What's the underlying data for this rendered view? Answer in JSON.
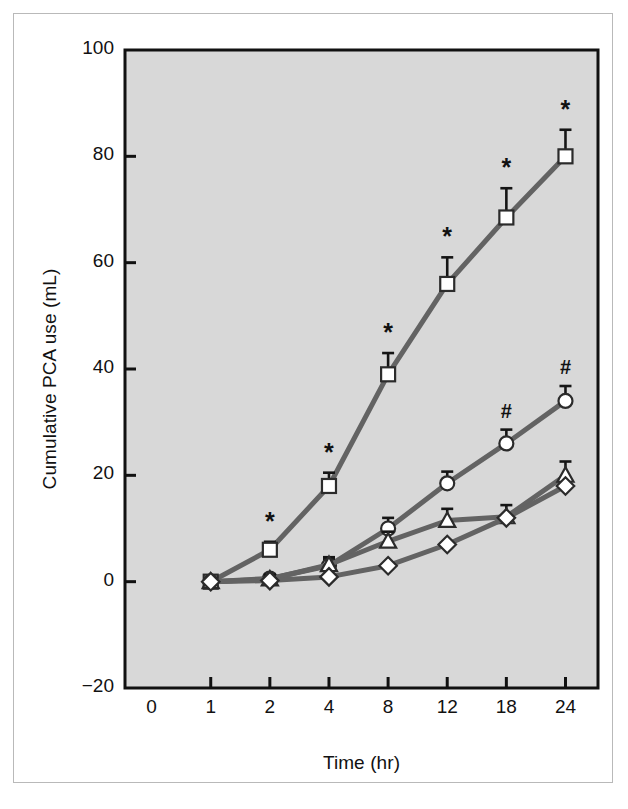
{
  "figure": {
    "background": "#ffffff",
    "plot_background": "#d8d8d8",
    "axis_color": "#111111",
    "series_line_color": "#636363",
    "marker_fill": "#ffffff",
    "marker_edge": "#2b2b2b"
  },
  "chart_data": {
    "type": "line",
    "title": "",
    "xlabel": "Time (hr)",
    "ylabel": "Cumulative PCA use (mL)",
    "x_scale": "ordinal",
    "categories": [
      "1",
      "2",
      "4",
      "8",
      "12",
      "18",
      "24"
    ],
    "xticks": [
      "0",
      "1",
      "2",
      "4",
      "8",
      "12",
      "18",
      "24"
    ],
    "yticks": [
      "-20",
      "0",
      "20",
      "40",
      "60",
      "80",
      "100"
    ],
    "ylim": [
      -20,
      100
    ],
    "grid": false,
    "legend": "none",
    "series": [
      {
        "name": "square-series",
        "marker": "square",
        "values": [
          0,
          6,
          18,
          39,
          56,
          68.5,
          80
        ],
        "errors": [
          0,
          1.5,
          2.5,
          4,
          5,
          5.5,
          5
        ],
        "annotations": [
          "",
          "*",
          "*",
          "*",
          "*",
          "*",
          "*"
        ]
      },
      {
        "name": "circle-series",
        "marker": "circle",
        "values": [
          0,
          0.6,
          3,
          10,
          18.5,
          26,
          34
        ],
        "errors": [
          0,
          0.8,
          1.2,
          2,
          2.2,
          2.6,
          2.8
        ],
        "annotations": [
          "",
          "",
          "",
          "",
          "",
          "#",
          "#"
        ]
      },
      {
        "name": "triangle-series",
        "marker": "triangle",
        "values": [
          0,
          0.5,
          3.2,
          7.6,
          11.5,
          12.2,
          20
        ],
        "errors": [
          0,
          0.8,
          1.4,
          1.8,
          2.2,
          2.2,
          2.6
        ],
        "annotations": [
          "",
          "",
          "",
          "",
          "",
          "",
          ""
        ]
      },
      {
        "name": "diamond-series",
        "marker": "diamond",
        "values": [
          0,
          0.2,
          0.9,
          3.0,
          7.0,
          12.0,
          18.0
        ],
        "errors": [
          0,
          0,
          0,
          0,
          0,
          0,
          0
        ],
        "annotations": [
          "",
          "",
          "",
          "",
          "",
          "",
          ""
        ]
      }
    ]
  }
}
